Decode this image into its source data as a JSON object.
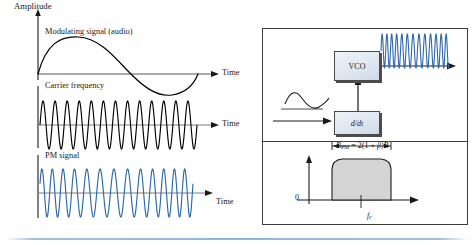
{
  "figure": {
    "left_plot": {
      "y_axis_label": "Amplitude",
      "traces": [
        {
          "id": "modulating",
          "label": "Modulating signal (audio)",
          "time_label": "Time",
          "color": "#000000",
          "type": "sine-envelope"
        },
        {
          "id": "carrier",
          "label": "Carrier frequency",
          "time_label": "Time",
          "color": "#000000",
          "type": "constant-frequency-sine",
          "cycles": 13
        },
        {
          "id": "pm",
          "label": "PM signal",
          "time_label": "Time",
          "color": "#2c68ab",
          "type": "phase-modulated-sine",
          "cycles": 13
        }
      ]
    },
    "right_panel": {
      "block_diagram": {
        "blocks": [
          {
            "id": "vco",
            "label": "VCO"
          },
          {
            "id": "differentiator",
            "label": "d/dt",
            "italic": true
          }
        ],
        "input_signal": "audio-sine",
        "output_signal": "pm-carrier",
        "output_color": "#2c68ab"
      },
      "spectrum": {
        "formula": "B_PM = 2(1 + β)B",
        "formula_parts": {
          "b": "B",
          "subscript": "PM",
          "equals": "= 2(1 + ",
          "beta": "β",
          "tail": ")B"
        },
        "origin_label": "0",
        "center_frequency_label": "f_c",
        "center_frequency_base": "f",
        "center_frequency_sub": "c",
        "band_fill": "#d4d4d4"
      }
    }
  },
  "colors": {
    "blue_trace": "#2c68ab",
    "black_trace": "#000000",
    "axis_gray": "#6e6e6e",
    "panel_border": "#3d3d3d",
    "rule_blue": "#8fb7dd"
  }
}
